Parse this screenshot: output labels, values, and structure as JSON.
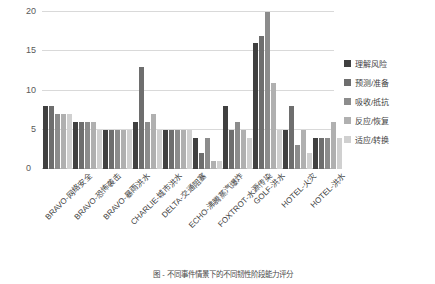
{
  "chart_data": {
    "type": "bar",
    "title": "",
    "xlabel": "",
    "ylabel": "",
    "ylim": [
      0,
      20
    ],
    "yticks": [
      0,
      5,
      10,
      15,
      20
    ],
    "grid": true,
    "legend_position": "right",
    "categories": [
      "BRAVO-网络安全",
      "BRAVO-恐怖袭击",
      "BRAVO-暴雨洪水",
      "CHARLIE-城市洪水",
      "DELTA-交通阻塞",
      "ECHO-沸腾蒸汽爆炸",
      "FOXTROT-水源传染",
      "GOLF-洪水",
      "HOTEL-火灾",
      "HOTEL-洪水"
    ],
    "series": [
      {
        "name": "理解风险",
        "color": "#404040",
        "values": [
          8,
          6,
          5,
          6,
          5,
          4,
          8,
          16,
          5,
          4
        ]
      },
      {
        "name": "预测/准备",
        "color": "#6e6e6e",
        "values": [
          8,
          6,
          5,
          13,
          5,
          2,
          5,
          17,
          8,
          4
        ]
      },
      {
        "name": "吸收/抵抗",
        "color": "#8c8c8c",
        "values": [
          7,
          6,
          5,
          6,
          5,
          4,
          6,
          20,
          3,
          4
        ]
      },
      {
        "name": "反应/恢复",
        "color": "#b0b0b0",
        "values": [
          7,
          6,
          5,
          7,
          5,
          1,
          5,
          11,
          5,
          6
        ]
      },
      {
        "name": "适应/转换",
        "color": "#d0d0d0",
        "values": [
          7,
          5,
          5,
          5,
          5,
          1,
          4,
          5,
          2,
          4
        ]
      }
    ]
  },
  "axis": {
    "zero_label": "0",
    "tick_labels": [
      "20",
      "15",
      "10",
      "5"
    ]
  },
  "legend": {
    "items": [
      {
        "label": "理解风险",
        "color": "#404040"
      },
      {
        "label": "预测/准备",
        "color": "#6e6e6e"
      },
      {
        "label": "吸收/抵抗",
        "color": "#8c8c8c"
      },
      {
        "label": "反应/恢复",
        "color": "#b0b0b0"
      },
      {
        "label": "适应/转换",
        "color": "#d0d0d0"
      }
    ]
  },
  "caption": {
    "text": "图 - 不同事件情景下的不同韧性阶段能力评分"
  }
}
